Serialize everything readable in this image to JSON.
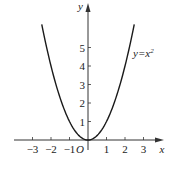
{
  "chart_data": {
    "type": "line",
    "title": "",
    "xlabel": "x",
    "ylabel": "y",
    "origin_label": "O",
    "function": "y = x^2",
    "series": [
      {
        "name": "y=x²",
        "label": "y=x",
        "label_superscript": "2",
        "x": [
          -2.5,
          -2.0,
          -1.5,
          -1.0,
          -0.5,
          0.0,
          0.5,
          1.0,
          1.5,
          2.0,
          2.5
        ],
        "y": [
          6.25,
          4.0,
          2.25,
          1.0,
          0.25,
          0.0,
          0.25,
          1.0,
          2.25,
          4.0,
          6.25
        ]
      }
    ],
    "x_ticks": [
      -3,
      -2,
      -1,
      1,
      2,
      3
    ],
    "x_tick_labels": [
      "−3",
      "−2",
      "−1",
      "1",
      "2",
      "3"
    ],
    "y_ticks": [
      1,
      2,
      3,
      4,
      5
    ],
    "y_tick_labels": [
      "1",
      "2",
      "3",
      "4",
      "5"
    ],
    "xlim": [
      -3.2,
      4.0
    ],
    "ylim": [
      0,
      6.8
    ],
    "grid": false,
    "legend": "inline label near right branch",
    "colors": {
      "curve": "#1a1a1a",
      "axis": "#333333",
      "text": "#222222"
    }
  }
}
